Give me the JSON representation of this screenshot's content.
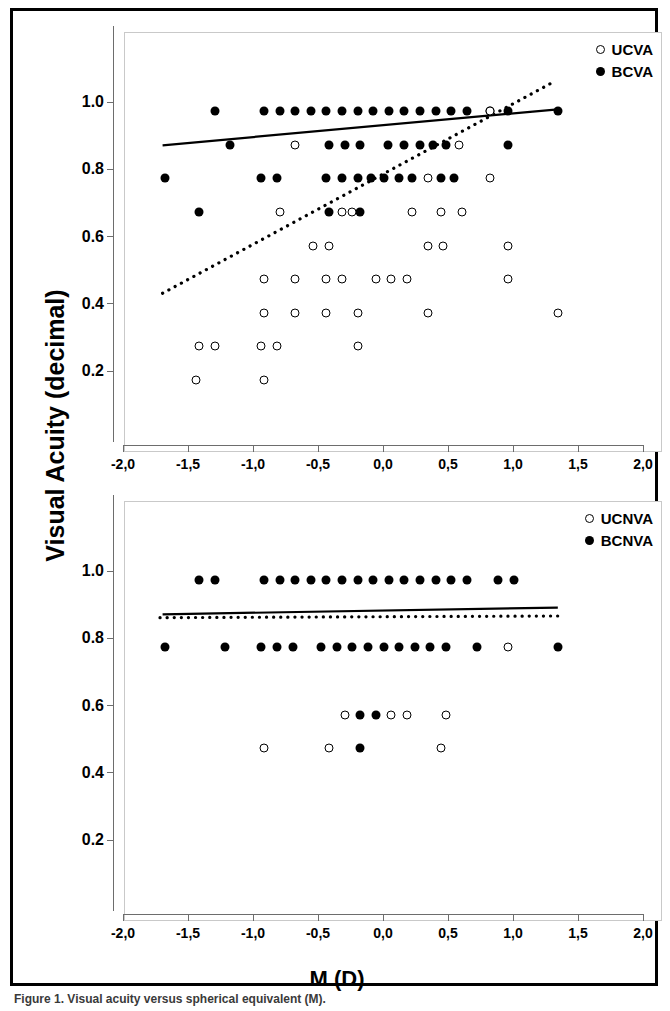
{
  "figure": {
    "y_axis_title": "Visual Acuity (decimal)",
    "x_axis_title": "M (D)",
    "caption": "Figure 1. Visual acuity versus spherical equivalent (M)."
  },
  "axes": {
    "x_tick_labels": [
      "-2,0",
      "-1,5",
      "-1,0",
      "-0,5",
      "0,0",
      "0,5",
      "1,0",
      "1,5",
      "2,0"
    ],
    "x_tick_values": [
      -2.0,
      -1.5,
      -1.0,
      -0.5,
      0.0,
      0.5,
      1.0,
      1.5,
      2.0
    ],
    "y_tick_labels": [
      "1.0",
      "0.8",
      "0.6",
      "0.4",
      "0.2"
    ],
    "y_tick_values": [
      1.0,
      0.8,
      0.6,
      0.4,
      0.2
    ],
    "xlim": [
      -2.0,
      2.0
    ],
    "ylim": [
      0.0,
      1.15
    ]
  },
  "legend_top": [
    {
      "label": "UCVA",
      "marker": "open-circle-icon"
    },
    {
      "label": "BCVA",
      "marker": "filled-circle-icon"
    }
  ],
  "legend_bottom": [
    {
      "label": "UCNVA",
      "marker": "open-circle-icon"
    },
    {
      "label": "BCNVA",
      "marker": "filled-circle-icon"
    }
  ],
  "chart_data": [
    {
      "type": "scatter",
      "panel": "top",
      "title": "",
      "xlabel": "M (D)",
      "ylabel": "Visual Acuity (decimal)",
      "xlim": [
        -2.0,
        2.0
      ],
      "ylim": [
        0.0,
        1.15
      ],
      "grid": false,
      "legend_position": "top-right",
      "series": [
        {
          "name": "BCVA",
          "marker": "filled-circle",
          "points": [
            [
              -1.38,
              1.0
            ],
            [
              -1.0,
              1.0
            ],
            [
              -0.88,
              1.0
            ],
            [
              -0.76,
              1.0
            ],
            [
              -0.64,
              1.0
            ],
            [
              -0.52,
              1.0
            ],
            [
              -0.4,
              1.0
            ],
            [
              -0.28,
              1.0
            ],
            [
              -0.16,
              1.0
            ],
            [
              -0.04,
              1.0
            ],
            [
              0.08,
              1.0
            ],
            [
              0.2,
              1.0
            ],
            [
              0.32,
              1.0
            ],
            [
              0.44,
              1.0
            ],
            [
              0.56,
              1.0
            ],
            [
              0.74,
              1.0
            ],
            [
              0.88,
              1.0
            ],
            [
              1.26,
              1.0
            ],
            [
              -1.26,
              0.9
            ],
            [
              -0.5,
              0.9
            ],
            [
              -0.38,
              0.9
            ],
            [
              -0.26,
              0.9
            ],
            [
              -0.05,
              0.9
            ],
            [
              0.08,
              0.9
            ],
            [
              0.2,
              0.9
            ],
            [
              0.3,
              0.9
            ],
            [
              0.4,
              0.9
            ],
            [
              0.88,
              0.9
            ],
            [
              -1.76,
              0.8
            ],
            [
              -1.02,
              0.8
            ],
            [
              -0.9,
              0.8
            ],
            [
              -0.52,
              0.8
            ],
            [
              -0.4,
              0.8
            ],
            [
              -0.28,
              0.8
            ],
            [
              -0.18,
              0.8
            ],
            [
              -0.08,
              0.8
            ],
            [
              0.04,
              0.8
            ],
            [
              0.14,
              0.8
            ],
            [
              0.36,
              0.8
            ],
            [
              0.46,
              0.8
            ],
            [
              -1.5,
              0.7
            ],
            [
              -0.5,
              0.7
            ],
            [
              -0.26,
              0.7
            ]
          ]
        },
        {
          "name": "UCVA",
          "marker": "open-circle",
          "points": [
            [
              0.74,
              1.0
            ],
            [
              -0.76,
              0.9
            ],
            [
              0.5,
              0.9
            ],
            [
              0.26,
              0.8
            ],
            [
              0.74,
              0.8
            ],
            [
              -0.88,
              0.7
            ],
            [
              -0.4,
              0.7
            ],
            [
              -0.32,
              0.7
            ],
            [
              0.14,
              0.7
            ],
            [
              0.36,
              0.7
            ],
            [
              0.52,
              0.7
            ],
            [
              -0.62,
              0.6
            ],
            [
              -0.5,
              0.6
            ],
            [
              0.26,
              0.6
            ],
            [
              0.38,
              0.6
            ],
            [
              0.88,
              0.6
            ],
            [
              -1.0,
              0.5
            ],
            [
              -0.76,
              0.5
            ],
            [
              -0.52,
              0.5
            ],
            [
              -0.4,
              0.5
            ],
            [
              -0.14,
              0.5
            ],
            [
              -0.02,
              0.5
            ],
            [
              0.1,
              0.5
            ],
            [
              0.88,
              0.5
            ],
            [
              -1.0,
              0.4
            ],
            [
              -0.76,
              0.4
            ],
            [
              -0.52,
              0.4
            ],
            [
              -0.28,
              0.4
            ],
            [
              0.26,
              0.4
            ],
            [
              1.26,
              0.4
            ],
            [
              -1.5,
              0.3
            ],
            [
              -1.38,
              0.3
            ],
            [
              -1.02,
              0.3
            ],
            [
              -0.9,
              0.3
            ],
            [
              -0.28,
              0.3
            ],
            [
              -1.52,
              0.2
            ],
            [
              -1.0,
              0.2
            ]
          ]
        }
      ],
      "trend_lines": [
        {
          "name": "BCVA-fit",
          "style": "solid",
          "x": [
            -1.78,
            1.26
          ],
          "y": [
            0.898,
            1.005
          ]
        },
        {
          "name": "UCVA-fit",
          "style": "dotted",
          "x": [
            -1.78,
            1.22
          ],
          "y": [
            0.458,
            1.085
          ]
        }
      ]
    },
    {
      "type": "scatter",
      "panel": "bottom",
      "title": "",
      "xlabel": "M (D)",
      "ylabel": "Visual Acuity (decimal)",
      "xlim": [
        -2.0,
        2.0
      ],
      "ylim": [
        0.0,
        1.15
      ],
      "grid": false,
      "legend_position": "top-right",
      "series": [
        {
          "name": "BCNVA",
          "marker": "filled-circle",
          "points": [
            [
              -1.5,
              1.0
            ],
            [
              -1.38,
              1.0
            ],
            [
              -1.0,
              1.0
            ],
            [
              -0.88,
              1.0
            ],
            [
              -0.76,
              1.0
            ],
            [
              -0.64,
              1.0
            ],
            [
              -0.52,
              1.0
            ],
            [
              -0.4,
              1.0
            ],
            [
              -0.28,
              1.0
            ],
            [
              -0.16,
              1.0
            ],
            [
              -0.04,
              1.0
            ],
            [
              0.08,
              1.0
            ],
            [
              0.2,
              1.0
            ],
            [
              0.32,
              1.0
            ],
            [
              0.44,
              1.0
            ],
            [
              0.56,
              1.0
            ],
            [
              0.8,
              1.0
            ],
            [
              0.92,
              1.0
            ],
            [
              -1.76,
              0.8
            ],
            [
              -1.3,
              0.8
            ],
            [
              -1.02,
              0.8
            ],
            [
              -0.9,
              0.8
            ],
            [
              -0.78,
              0.8
            ],
            [
              -0.56,
              0.8
            ],
            [
              -0.44,
              0.8
            ],
            [
              -0.32,
              0.8
            ],
            [
              -0.2,
              0.8
            ],
            [
              -0.08,
              0.8
            ],
            [
              0.04,
              0.8
            ],
            [
              0.16,
              0.8
            ],
            [
              0.28,
              0.8
            ],
            [
              0.4,
              0.8
            ],
            [
              0.64,
              0.8
            ],
            [
              1.26,
              0.8
            ],
            [
              -0.26,
              0.6
            ],
            [
              -0.14,
              0.6
            ],
            [
              -0.26,
              0.5
            ]
          ]
        },
        {
          "name": "UCNVA",
          "marker": "open-circle",
          "points": [
            [
              0.88,
              0.8
            ],
            [
              -0.38,
              0.6
            ],
            [
              -0.02,
              0.6
            ],
            [
              0.1,
              0.6
            ],
            [
              0.4,
              0.6
            ],
            [
              -1.0,
              0.5
            ],
            [
              -0.5,
              0.5
            ],
            [
              0.36,
              0.5
            ]
          ]
        }
      ],
      "trend_lines": [
        {
          "name": "BCNVA-fit",
          "style": "solid",
          "x": [
            -1.78,
            1.26
          ],
          "y": [
            0.898,
            0.918
          ]
        },
        {
          "name": "UCNVA-fit",
          "style": "dotted",
          "x": [
            -1.8,
            1.26
          ],
          "y": [
            0.888,
            0.893
          ]
        }
      ]
    }
  ]
}
